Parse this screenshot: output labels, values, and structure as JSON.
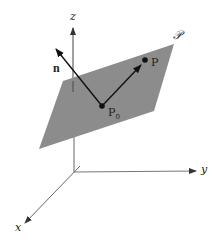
{
  "diagram": {
    "type": "3d-plane-with-normal-vector",
    "colors": {
      "plane": "#8c8c8c",
      "axis": "#555555",
      "vector": "#111111",
      "text": "#222222"
    },
    "axes": {
      "x_label": "x",
      "y_label": "y",
      "z_label": "z"
    },
    "plane_label": "𝒫",
    "normal_label": "n",
    "points": {
      "base": {
        "label": "P",
        "subscript": "0"
      },
      "other": {
        "label": "P"
      }
    }
  }
}
